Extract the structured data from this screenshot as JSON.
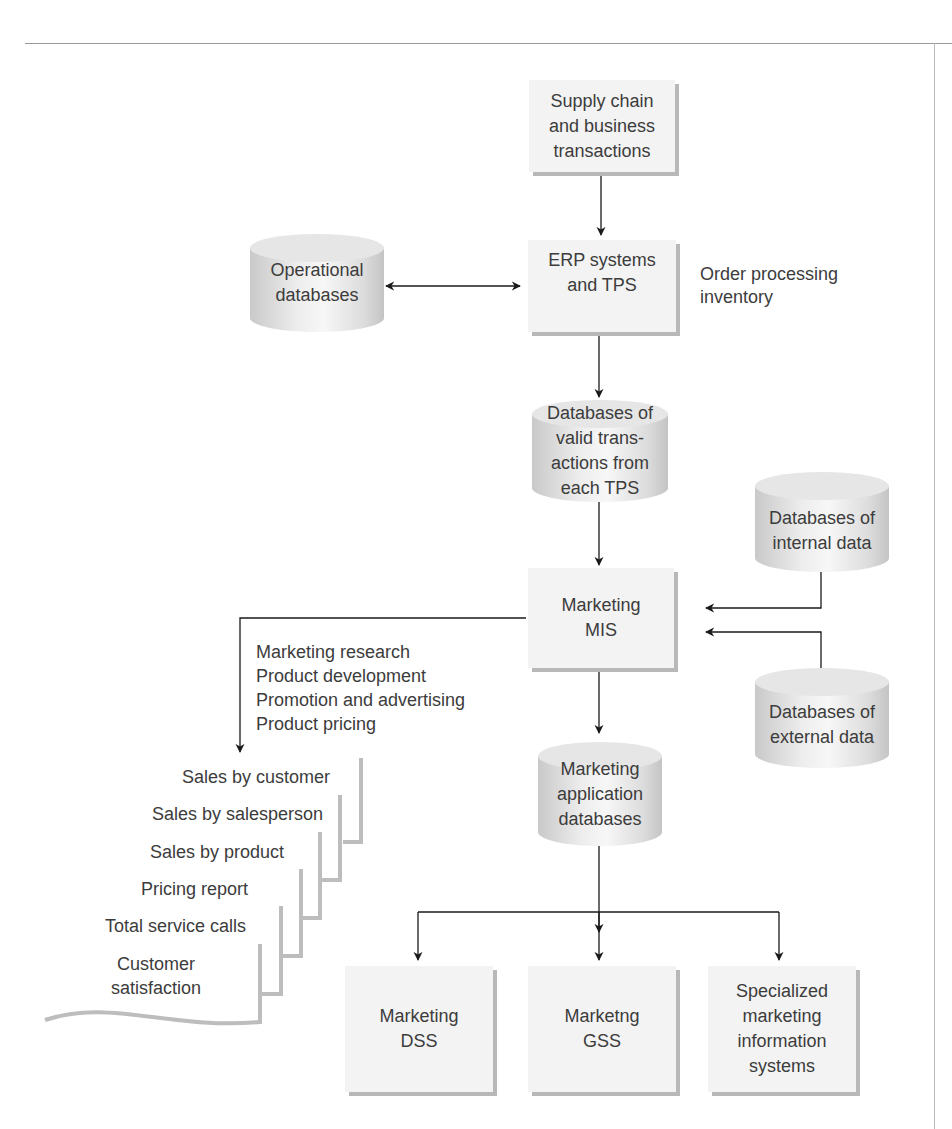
{
  "nodes": {
    "supply_chain": "Supply chain\nand business\ntransactions",
    "erp": "ERP systems\nand TPS",
    "operational_db": "Operational\ndatabases",
    "erp_note": "Order processing\ninventory",
    "valid_tx_db": "Databases of\nvalid trans-\nactions from\neach TPS",
    "internal_db": "Databases of\ninternal data",
    "external_db": "Databases of\nexternal data",
    "marketing_mis": "Marketing\nMIS",
    "mis_functions": "Marketing research\nProduct development\nPromotion and advertising\nProduct pricing",
    "marketing_app_db": "Marketing\napplication\ndatabases",
    "marketing_dss": "Marketing\nDSS",
    "marketing_gss": "Marketng\nGSS",
    "specialized": "Specialized\nmarketing\ninformation\nsystems"
  },
  "reports": [
    "Sales by customer",
    "Sales by salesperson",
    "Sales by product",
    "Pricing report",
    "Total service calls",
    "Customer\nsatisfaction"
  ],
  "colors": {
    "box_fill": "#f3f3f3",
    "box_shadow": "#b8b8b8",
    "line": "#1a1a1a",
    "text": "#3c3c3c"
  }
}
